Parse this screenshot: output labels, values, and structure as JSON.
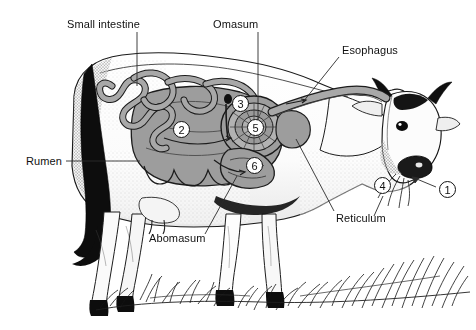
{
  "figure": {
    "background_color": "#ffffff",
    "ink_color": "#111111",
    "organ_fill_color": "#9a9a9a",
    "organ_fill_light": "#b5b5b5",
    "width": 476,
    "height": 330
  },
  "labels": [
    {
      "id": "small-intestine",
      "text": "Small intestine",
      "x": 67,
      "y": 18
    },
    {
      "id": "omasum",
      "text": "Omasum",
      "x": 213,
      "y": 18
    },
    {
      "id": "esophagus",
      "text": "Esophagus",
      "x": 342,
      "y": 44
    },
    {
      "id": "rumen",
      "text": "Rumen",
      "x": 26,
      "y": 155
    },
    {
      "id": "abomasum",
      "text": "Abomasum",
      "x": 149,
      "y": 232
    },
    {
      "id": "reticulum",
      "text": "Reticulum",
      "x": 336,
      "y": 212
    }
  ],
  "callout_numbers": [
    {
      "id": "callout-1",
      "value": "1",
      "x": 439,
      "y": 181,
      "refers_to": "mouth"
    },
    {
      "id": "callout-2",
      "value": "2",
      "x": 173,
      "y": 121,
      "refers_to": "rumen"
    },
    {
      "id": "callout-3",
      "value": "3",
      "x": 232,
      "y": 95,
      "refers_to": "omasum"
    },
    {
      "id": "callout-4",
      "value": "4",
      "x": 374,
      "y": 177,
      "refers_to": "esophagus-entry"
    },
    {
      "id": "callout-5",
      "value": "5",
      "x": 247,
      "y": 119,
      "refers_to": "reticulum"
    },
    {
      "id": "callout-6",
      "value": "6",
      "x": 246,
      "y": 157,
      "refers_to": "abomasum"
    }
  ],
  "leader_lines": [
    {
      "id": "leader-small-intestine",
      "path": "M137,32 L137,86"
    },
    {
      "id": "leader-omasum",
      "path": "M258,32 L258,120"
    },
    {
      "id": "leader-esophagus",
      "path": "M339,57 L303,102"
    },
    {
      "id": "leader-rumen",
      "path": "M66,161 L140,161"
    },
    {
      "id": "leader-abomasum",
      "path": "M205,234 L237,176"
    },
    {
      "id": "leader-reticulum",
      "path": "M334,211 L296,139"
    },
    {
      "id": "leader-mouth-arrow",
      "path": "M436,186 L410,177"
    }
  ]
}
